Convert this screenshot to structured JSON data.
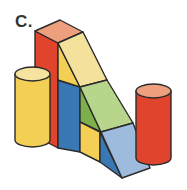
{
  "label": "C.",
  "figure": {
    "colors": {
      "red": "#e0442c",
      "red_top": "#eea07e",
      "yellow": "#f4cf55",
      "yellow_light": "#f4e29c",
      "yellow_top": "#f6e3a0",
      "blue": "#3a78b5",
      "blue_light": "#9dbbdc",
      "green_light": "#b7d68c",
      "green_dark": "#7db04c",
      "outline": "#2b2b2b"
    }
  }
}
